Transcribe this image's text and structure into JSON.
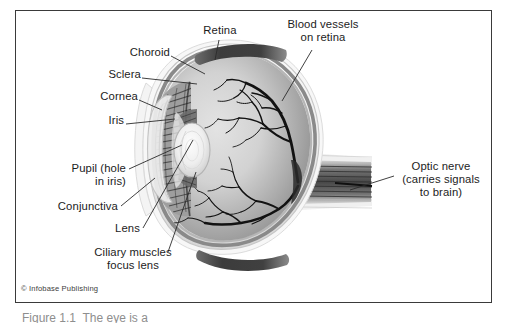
{
  "figure": {
    "credit": "© Infobase Publishing",
    "caption_fragment": "Figure 1.1  The eye is a",
    "frame_color": "#3a3a3a",
    "background": "#ffffff"
  },
  "labels": {
    "retina": "Retina",
    "choroid": "Choroid",
    "sclera": "Sclera",
    "cornea": "Cornea",
    "iris": "Iris",
    "pupil": "Pupil (hole\nin iris)",
    "pupil_line1": "Pupil (hole",
    "pupil_line2": "in iris)",
    "conjunctiva": "Conjunctiva",
    "lens": "Lens",
    "ciliary_line1": "Ciliary muscles",
    "ciliary_line2": "focus lens",
    "blood_line1": "Blood vessels",
    "blood_line2": "on retina",
    "optic_line1": "Optic nerve",
    "optic_line2": "(carries signals",
    "optic_line3": "to brain)"
  },
  "parts": [
    {
      "name": "retina",
      "label": "Retina"
    },
    {
      "name": "choroid",
      "label": "Choroid"
    },
    {
      "name": "sclera",
      "label": "Sclera"
    },
    {
      "name": "cornea",
      "label": "Cornea"
    },
    {
      "name": "iris",
      "label": "Iris"
    },
    {
      "name": "pupil",
      "label": "Pupil (hole in iris)"
    },
    {
      "name": "conjunctiva",
      "label": "Conjunctiva"
    },
    {
      "name": "lens",
      "label": "Lens"
    },
    {
      "name": "ciliary-muscles",
      "label": "Ciliary muscles focus lens"
    },
    {
      "name": "blood-vessels",
      "label": "Blood vessels on retina"
    },
    {
      "name": "optic-nerve",
      "label": "Optic nerve (carries signals to brain)"
    }
  ],
  "colors": {
    "ink": "#1c1c1c",
    "leader": "#2b2b2b",
    "sclera_outer": "#f2f2f2",
    "sclera_mid": "#cfcfcf",
    "choroid": "#8d8d8d",
    "vitreous_light": "#d8d8d8",
    "vitreous_dark": "#8a8a8a",
    "muscle_dark": "#4a4a4a",
    "vessel": "#141414",
    "lens_light": "#f6f6f6",
    "ciliary": "#6f6f6f"
  }
}
